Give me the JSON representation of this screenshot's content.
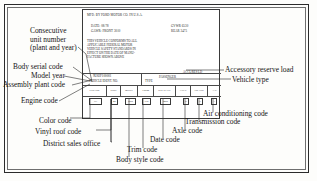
{
  "label": {
    "mfg_line": "MFD. BY FORD MOTOR CO. IN U.S.A.",
    "date_line": "DATE: 08/78",
    "gawr_line": "GAWR: FRONT 3010",
    "gvwr_line": "GVWR 6530",
    "rear_line": "REAR 3475",
    "conformance": [
      "THIS VEHICLE CONFORMS TO ALL",
      "APPLICABLE FEDERAL MOTOR",
      "VEHICLE SAFETY STANDARDS IN",
      "EFFECT ON THE DATE OF MANU-",
      "FACTURE SHOWN ABOVE"
    ],
    "vin_code": "9U82F100001",
    "vin_caption": "VEHICLE IDENT. NO.",
    "type_caption": "TYPE",
    "type_value": "PASSENGER",
    "arl_label": "ACCL/RES LD",
    "columns": [
      {
        "header": "COLOR",
        "value": "1C"
      },
      {
        "header": "DSO",
        "value": "46"
      },
      {
        "header": "BODY",
        "value": "65B"
      },
      {
        "header": "TRIM",
        "value": "CB"
      },
      {
        "header": "S/D DATE",
        "value": "08B"
      },
      {
        "header": "AXLE",
        "value": "6"
      },
      {
        "header": "TRANS",
        "value": "X"
      },
      {
        "header": "A/C",
        "value": "A"
      }
    ]
  },
  "annotations": {
    "consecutive_unit_number": [
      "Consecutive",
      "unit number",
      "(plant and year)"
    ],
    "body_serial_code": "Body serial code",
    "model_year": "Model year",
    "assembly_plant_code": "Assembly plant code",
    "engine_code": "Engine code",
    "color_code": "Color code",
    "vinyl_roof_code": "Vinyl roof code",
    "district_sales_office": "District sales office",
    "body_style_code": "Body style code",
    "trim_code": "Trim code",
    "date_code": "Date code",
    "axle_code": "Axle code",
    "transmission_code": "Transmission code",
    "air_conditioning_code": "Air conditioning code",
    "accessory_reserve_load": "Accessory reserve load",
    "vehicle_type": "Vehicle type"
  },
  "colors": {
    "ink": "#1d1d1d",
    "frame": "#2b2b2b",
    "paper": "#fdfdfb"
  }
}
